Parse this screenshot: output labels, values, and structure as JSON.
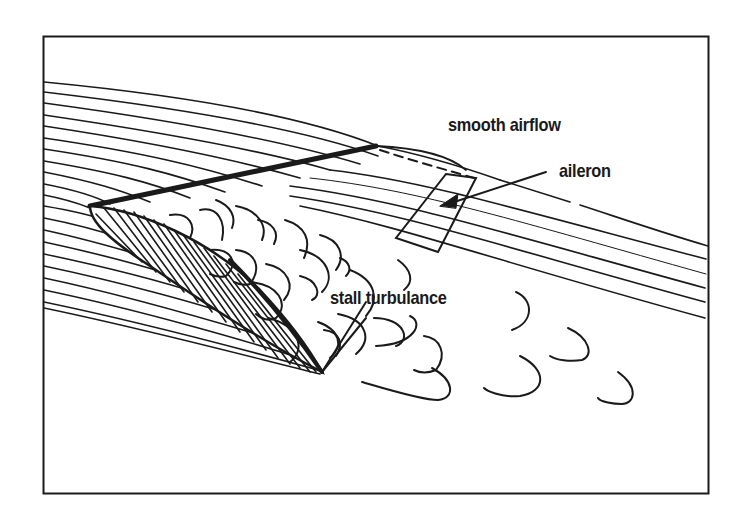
{
  "diagram": {
    "labels": {
      "smooth_airflow": "smooth airflow",
      "aileron": "aileron",
      "stall_turbulance": "stall turbulance"
    },
    "colors": {
      "ink": "#1a1a1a",
      "background": "#ffffff"
    }
  }
}
